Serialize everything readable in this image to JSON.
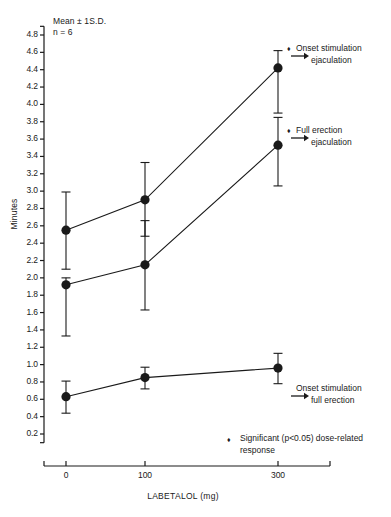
{
  "annotation": {
    "line1": "Mean ± 1S.D.",
    "line2": "n = 6"
  },
  "axes": {
    "ylabel": "Minutes",
    "xlabel": "LABETALOL (mg)",
    "yticks": [
      "4.8",
      "4.6",
      "4.4",
      "4.2",
      "4.0",
      "3.8",
      "3.6",
      "3.4",
      "3.2",
      "3.0",
      "2.8",
      "2.6",
      "2.4",
      "2.2",
      "2.0",
      "1.8",
      "1.6",
      "1.4",
      "1.2",
      "1.0",
      "0.8",
      "0.6",
      "0.4",
      "0.2"
    ],
    "xticks": [
      "0",
      "100",
      "300"
    ]
  },
  "series_labels": [
    {
      "line1": "Onset stimulation",
      "line2": "ejaculation",
      "marker": "♦",
      "arrow": "→"
    },
    {
      "line1": "Full erection",
      "line2": "ejaculation",
      "marker": "♦",
      "arrow": "→"
    },
    {
      "line1": "Onset stimulation",
      "line2": "full erection",
      "marker": "",
      "arrow": "→"
    }
  ],
  "footnote": {
    "marker": "♦",
    "text": "Significant (p<0.05) dose-related response"
  },
  "colors": {
    "ink": "#1a1a1a",
    "line": "#262626"
  },
  "chart_data": {
    "type": "line",
    "title": "",
    "xlabel": "LABETALOL (mg)",
    "ylabel": "Minutes",
    "x": [
      0,
      100,
      300
    ],
    "xlim": [
      0,
      340
    ],
    "ylim": [
      0,
      4.9
    ],
    "grid": false,
    "legend": "right-inline",
    "errorbars": "1 S.D.",
    "series": [
      {
        "name": "Onset stimulation → ejaculation",
        "values": [
          2.55,
          2.9,
          4.42
        ],
        "err_low": [
          2.1,
          2.48,
          3.9
        ],
        "err_high": [
          2.99,
          3.33,
          4.62
        ],
        "significant": true
      },
      {
        "name": "Full erection → ejaculation",
        "values": [
          1.92,
          2.15,
          3.53
        ],
        "err_low": [
          1.33,
          1.63,
          3.06
        ],
        "err_high": [
          2.0,
          2.66,
          3.85
        ],
        "significant": true
      },
      {
        "name": "Onset stimulation → full erection",
        "values": [
          0.63,
          0.85,
          0.96
        ],
        "err_low": [
          0.44,
          0.72,
          0.78
        ],
        "err_high": [
          0.81,
          0.97,
          1.13
        ],
        "significant": false
      }
    ]
  }
}
